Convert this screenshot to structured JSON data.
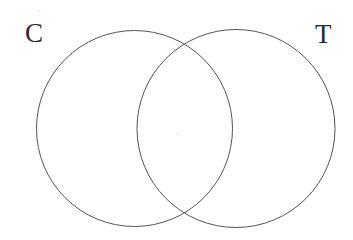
{
  "diagram": {
    "type": "venn",
    "title": "",
    "background_color": "#ffffff",
    "stroke_color": "#555555",
    "stroke_width": 1,
    "label_color": "#2b2b2b",
    "canvas": {
      "width": 353,
      "height": 240
    },
    "sets": [
      {
        "id": "set-c",
        "label": "C",
        "label_position": "top-left",
        "label_x": 25,
        "label_y": 20,
        "circle": {
          "cx": 134.5,
          "cy": 128.5,
          "r": 98
        },
        "content": ""
      },
      {
        "id": "set-t",
        "label": "T",
        "label_position": "top-right",
        "label_x": 315,
        "label_y": 21,
        "circle": {
          "cx": 236,
          "cy": 128.5,
          "r": 99
        },
        "content": ""
      }
    ],
    "regions": [
      {
        "id": "region-c-only",
        "name": "C only",
        "content": ""
      },
      {
        "id": "region-intersection",
        "name": "C and T",
        "content": ""
      },
      {
        "id": "region-t-only",
        "name": "T only",
        "content": ""
      }
    ],
    "artifacts": [
      {
        "id": "speck-top-left",
        "x": 38,
        "y": 10,
        "size": 2
      },
      {
        "id": "speck-center",
        "x": 177,
        "y": 133,
        "size": 2
      }
    ]
  }
}
